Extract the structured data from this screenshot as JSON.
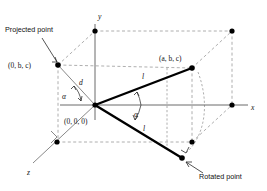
{
  "figure": {
    "background_color": "#ffffff",
    "axes": {
      "y_label": "y",
      "x_label": "x",
      "z_label": "z"
    },
    "annotations": {
      "projected_point_label": "Projected point",
      "rotated_point_label": "Rotated point",
      "origin_label": "(0, 0, 0)",
      "projected_coord_label": "(0, b, c)",
      "source_coord_label": "(a, b, c)",
      "distance_label": "d",
      "length_upper_label": "l",
      "length_lower_label": "l",
      "angle_upper_label": "α",
      "angle_lower_label": "α"
    },
    "colors": {
      "ink": "#000000",
      "axis": "#6b6b6b",
      "dashed": "#9a9a9a",
      "vector": "#000000"
    },
    "points": [
      {
        "name": "origin",
        "label": "(0, 0, 0)",
        "x": 95,
        "y": 105
      },
      {
        "name": "projected-point",
        "label": "(0, b, c)",
        "x": 58,
        "y": 65
      },
      {
        "name": "source-point",
        "label": "(a, b, c)",
        "x": 192,
        "y": 68
      },
      {
        "name": "rotated-point",
        "label": "Rotated point",
        "x": 182,
        "y": 158
      },
      {
        "name": "y-axis-node",
        "label": "",
        "x": 95,
        "y": 31
      },
      {
        "name": "top-right-node",
        "label": "",
        "x": 232,
        "y": 31
      },
      {
        "name": "x-axis-node",
        "label": "",
        "x": 232,
        "y": 105
      },
      {
        "name": "z-axis-node",
        "label": "",
        "x": 57,
        "y": 142
      },
      {
        "name": "front-bottom-node",
        "label": "",
        "x": 192,
        "y": 142
      }
    ]
  }
}
